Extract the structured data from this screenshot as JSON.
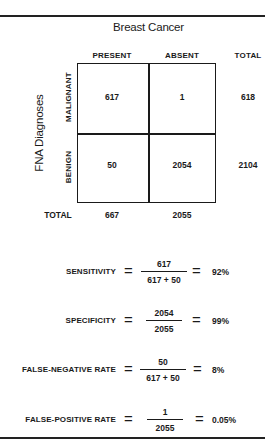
{
  "figure": {
    "title": "Breast Cancer",
    "row_axis_label": "FNA Diagnoses",
    "columns": [
      "PRESENT",
      "ABSENT",
      "TOTAL"
    ],
    "rows": [
      {
        "label": "MALIGNANT",
        "present": "617",
        "absent": "1",
        "total": "618"
      },
      {
        "label": "BENIGN",
        "present": "50",
        "absent": "2054",
        "total": "2104"
      }
    ],
    "totals": {
      "label": "TOTAL",
      "present": "667",
      "absent": "2055"
    }
  },
  "formulas": [
    {
      "label": "SENSITIVITY",
      "eq": "=",
      "numerator": "617",
      "denominator": "617 + 50",
      "eq2": "=",
      "result": "92%"
    },
    {
      "label": "SPECIFICITY",
      "eq": "=",
      "numerator": "2054",
      "denominator": "2055",
      "eq2": "=",
      "result": "99%"
    },
    {
      "label": "FALSE-NEGATIVE RATE",
      "eq": "=",
      "numerator": "50",
      "denominator": "617 + 50",
      "eq2": "=",
      "result": "8%"
    },
    {
      "label": "FALSE-POSITIVE RATE",
      "eq": "=",
      "numerator": "1",
      "denominator": "2055",
      "eq2": "=",
      "result": "0.05%"
    }
  ]
}
